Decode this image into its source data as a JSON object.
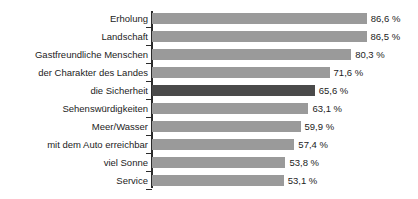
{
  "chart_data": {
    "type": "bar",
    "orientation": "horizontal",
    "title": "",
    "xlabel": "",
    "ylabel": "",
    "xlim": [
      0,
      100
    ],
    "grid": false,
    "legend": false,
    "value_suffix": " %",
    "decimal_separator": ",",
    "categories": [
      "Erholung",
      "Landschaft",
      "Gastfreundliche Menschen",
      "der Charakter des Landes",
      "die Sicherheit",
      "Sehenswürdigkeiten",
      "Meer/Wasser",
      "mit dem Auto erreichbar",
      "viel Sonne",
      "Service"
    ],
    "values": [
      86.6,
      86.5,
      80.3,
      71.6,
      65.6,
      63.1,
      59.9,
      57.4,
      53.8,
      53.1
    ],
    "value_labels": [
      "86,6 %",
      "86,5 %",
      "80,3 %",
      "71,6 %",
      "65,6 %",
      "63,1 %",
      "59,9 %",
      "57,4 %",
      "53,8 %",
      "53,1 %"
    ],
    "highlight_index": 4,
    "colors": {
      "bar": "#9a9a9a",
      "bar_highlight": "#4a4a4a",
      "axis": "#2b2b2b",
      "text": "#1c1c1c",
      "background": "#ffffff"
    }
  }
}
